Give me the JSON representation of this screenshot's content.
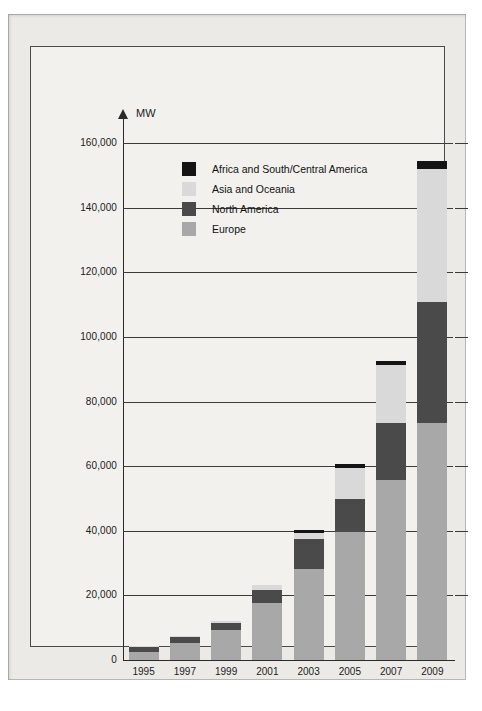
{
  "chart_data": {
    "type": "bar",
    "subtype": "stacked-bar",
    "title": "",
    "xlabel": "",
    "ylabel": "MW",
    "axis_unit_label": "MW",
    "categories": [
      "1995",
      "1997",
      "1999",
      "2001",
      "2003",
      "2005",
      "2007",
      "2009"
    ],
    "ylim": [
      0,
      160000
    ],
    "yticks": [
      0,
      20000,
      40000,
      60000,
      80000,
      100000,
      120000,
      140000,
      160000
    ],
    "ytick_labels": [
      "0",
      "20,000",
      "40,000",
      "60,000",
      "80,000",
      "100,000",
      "120,000",
      "140,000",
      "160,000"
    ],
    "grid": true,
    "legend_position": "inside-upper-left",
    "series": [
      {
        "name": "Europe",
        "color": "#a8a8a8",
        "values": [
          2500,
          5300,
          9300,
          17600,
          28200,
          39700,
          55700,
          73500
        ]
      },
      {
        "name": "North America",
        "color": "#4a4a4a",
        "values": [
          1400,
          1800,
          2100,
          4000,
          9300,
          10200,
          17800,
          37400
        ]
      },
      {
        "name": "Asia and Oceania",
        "color": "#d9d9d9",
        "values": [
          200,
          300,
          600,
          1700,
          1900,
          9500,
          17800,
          41000
        ]
      },
      {
        "name": "Africa and South/Central America",
        "color": "#141414",
        "values": [
          0,
          0,
          0,
          0,
          700,
          1200,
          1100,
          2600
        ]
      }
    ],
    "totals": [
      4100,
      7400,
      12000,
      23300,
      40100,
      60600,
      92400,
      154500
    ]
  },
  "legend": {
    "items": [
      {
        "label": "Africa and South/Central America",
        "color": "#141414"
      },
      {
        "label": "Asia and Oceania",
        "color": "#d9d9d9"
      },
      {
        "label": "North America",
        "color": "#4a4a4a"
      },
      {
        "label": "Europe",
        "color": "#a8a8a8"
      }
    ]
  },
  "colors": {
    "page_background": "#ffffff",
    "margin": "#eceae7",
    "chart_background": "#f2f1ee",
    "axis": "#2a2a2a",
    "grid": "#3b3b3b",
    "text": "#1a1a1a"
  }
}
